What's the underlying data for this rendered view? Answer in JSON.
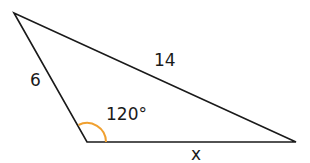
{
  "diagram": {
    "type": "triangle",
    "vertices": {
      "top_left": [
        14,
        13
      ],
      "bottom_left": [
        87,
        142
      ],
      "bottom_right": [
        296,
        142
      ]
    },
    "sides": {
      "left": "6",
      "top": "14",
      "bottom": "x"
    },
    "angle": {
      "label": "120°",
      "vertex": "bottom_left",
      "arc_color": "#f0a030"
    },
    "stroke_color": "#1a1a1a"
  }
}
